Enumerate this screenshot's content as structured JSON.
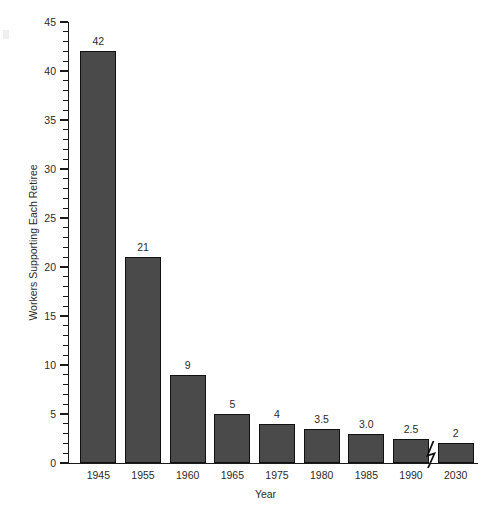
{
  "chart_data": {
    "type": "bar",
    "title": "",
    "subtitle": "",
    "xlabel": "Year",
    "ylabel": "Workers Supporting Each Retiree",
    "categories": [
      "1945",
      "1955",
      "1960",
      "1965",
      "1975",
      "1980",
      "1985",
      "1990",
      "2030"
    ],
    "values": [
      42,
      21,
      9,
      5,
      4,
      3.5,
      3.0,
      2.5,
      2
    ],
    "value_labels": [
      "42",
      "21",
      "9",
      "5",
      "4",
      "3.5",
      "3.0",
      "2.5",
      "2"
    ],
    "ylim": [
      0,
      45
    ],
    "xlim_note": "categorical",
    "y_major_ticks": [
      0,
      5,
      10,
      15,
      20,
      25,
      30,
      35,
      40,
      45
    ],
    "y_major_tick_labels": [
      "0",
      "5",
      "10",
      "15",
      "20",
      "25",
      "30",
      "35",
      "40",
      "45"
    ],
    "y_minor_tick_interval": 1,
    "grid": false,
    "legend": null,
    "legend_position": "none",
    "bar_color": "#4a4a4a",
    "bar_edge_color": "#111111",
    "axis_color": "#1a1a1a",
    "background_color": "#ffffff",
    "annotations": [
      {
        "name": "x-axis-break",
        "type": "axis-break-zigzag",
        "between": [
          "1990",
          "2030"
        ],
        "note": "Broken x-axis indicating a time gap between 1990 and the 2030 projection"
      }
    ]
  },
  "icons": {
    "axis_break": "zigzag-break-icon"
  }
}
